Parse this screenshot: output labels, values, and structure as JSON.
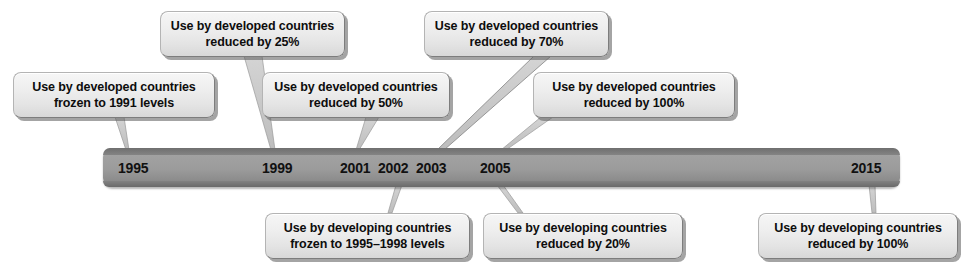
{
  "diagram": {
    "type": "timeline"
  },
  "timeline": {
    "bar_color": "#9b9b9b",
    "bar_edge_color": "#6f6f6f",
    "ticks": [
      {
        "year": "1995"
      },
      {
        "year": "1999"
      },
      {
        "year": "2001"
      },
      {
        "year": "2002"
      },
      {
        "year": "2003"
      },
      {
        "year": "2005"
      },
      {
        "year": "2015"
      }
    ]
  },
  "callouts_above": [
    {
      "text": "Use by developed countries\nfrozen to 1991 levels",
      "year": "1995"
    },
    {
      "text": "Use by developed countries\nreduced by 25%",
      "year": "1999"
    },
    {
      "text": "Use by developed countries\nreduced by 50%",
      "year": "2001"
    },
    {
      "text": "Use by developed countries\nreduced by 70%",
      "year": "2003"
    },
    {
      "text": "Use by developed countries\nreduced by 100%",
      "year": "2005"
    }
  ],
  "callouts_below": [
    {
      "text": "Use by developing countries\nfrozen to 1995–1998 levels",
      "year": "2002"
    },
    {
      "text": "Use by developing countries\nreduced by 20%",
      "year": "2005"
    },
    {
      "text": "Use by developing countries\nreduced by 100%",
      "year": "2015"
    }
  ],
  "colors": {
    "background": "#ffffff",
    "box_fill": "#ebebeb",
    "box_shadow": "#5a5a5a",
    "text": "#0d0d0d"
  }
}
